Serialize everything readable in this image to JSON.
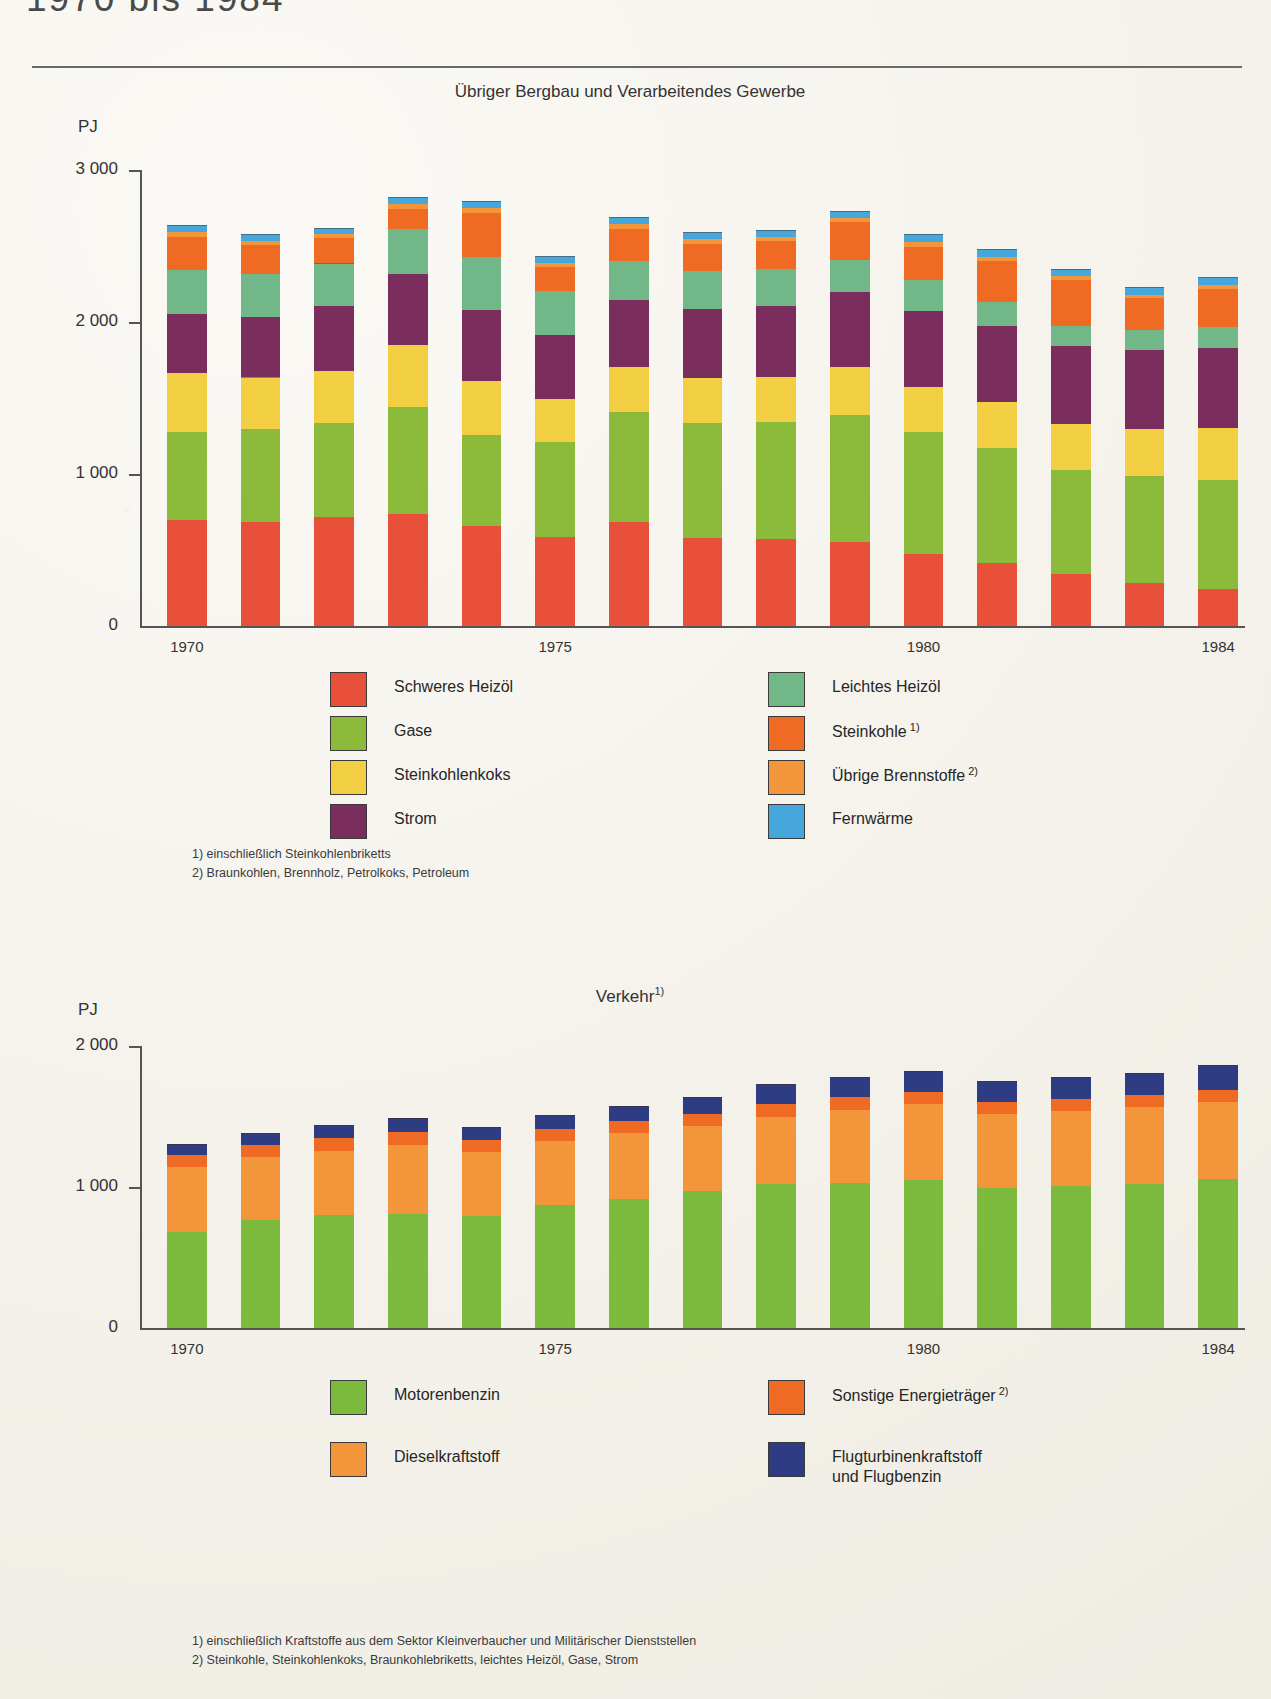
{
  "document": {
    "title": "1970 bis 1984"
  },
  "charts": [
    {
      "id": "bergbau-gewerbe",
      "title": "Übriger Bergbau und Verarbeitendes Gewerbe",
      "title_sup": "",
      "unit": "PJ",
      "y_ticks": [
        "3 000",
        "2 000",
        "1 000",
        "0"
      ],
      "x_ticks": [
        "1970",
        "1975",
        "1980",
        "1984"
      ],
      "footnotes": [
        "1) einschließlich Steinkohlenbriketts",
        "2) Braunkohlen, Brennholz, Petrolkoks, Petroleum"
      ],
      "legend": [
        {
          "label": "Schweres Heizöl",
          "sup": "",
          "color": "#e8503a",
          "col": 0,
          "row": 0
        },
        {
          "label": "Gase",
          "sup": "",
          "color": "#8cbb3c",
          "col": 0,
          "row": 1
        },
        {
          "label": "Steinkohlenkoks",
          "sup": "",
          "color": "#f2ce43",
          "col": 0,
          "row": 2
        },
        {
          "label": "Strom",
          "sup": "",
          "color": "#7b2d5e",
          "col": 0,
          "row": 3
        },
        {
          "label": "Leichtes Heizöl",
          "sup": "",
          "color": "#72b788",
          "col": 1,
          "row": 0
        },
        {
          "label": "Steinkohle",
          "sup": "1)",
          "color": "#ef6a23",
          "col": 1,
          "row": 1
        },
        {
          "label": "Übrige Brennstoffe",
          "sup": "2)",
          "color": "#f2953b",
          "col": 1,
          "row": 2
        },
        {
          "label": "Fernwärme",
          "sup": "",
          "color": "#46a7dd",
          "col": 1,
          "row": 3
        }
      ]
    },
    {
      "id": "verkehr",
      "title": "Verkehr",
      "title_sup": "1)",
      "unit": "PJ",
      "y_ticks": [
        "2 000",
        "1 000",
        "0"
      ],
      "x_ticks": [
        "1970",
        "1975",
        "1980",
        "1984"
      ],
      "footnotes": [
        "1) einschließlich Kraftstoffe aus dem Sektor Kleinverbaucher und Militärischer Dienststellen",
        "2) Steinkohle, Steinkohlenkoks, Braunkohlebriketts, leichtes Heizöl, Gase, Strom"
      ],
      "legend": [
        {
          "label": "Motorenbenzin",
          "sup": "",
          "color": "#7cba3d",
          "col": 0,
          "row": 0,
          "label2": ""
        },
        {
          "label": "Dieselkraftstoff",
          "sup": "",
          "color": "#f2953b",
          "col": 0,
          "row": 1,
          "label2": ""
        },
        {
          "label": "Sonstige Energieträger",
          "sup": "2)",
          "color": "#ef6a23",
          "col": 1,
          "row": 0,
          "label2": ""
        },
        {
          "label": "Flugturbinenkraftstoff",
          "sup": "",
          "color": "#2d3c83",
          "col": 1,
          "row": 1,
          "label2": "und Flugbenzin"
        }
      ]
    }
  ],
  "chart_data": [
    {
      "type": "bar",
      "stacked": true,
      "title": "Übriger Bergbau und Verarbeitendes Gewerbe",
      "xlabel": "",
      "ylabel": "PJ",
      "ylim": [
        0,
        3000
      ],
      "ytick_values": [
        0,
        1000,
        2000,
        3000
      ],
      "grid": false,
      "legend_position": "below",
      "categories": [
        "1970",
        "1971",
        "1972",
        "1973",
        "1974",
        "1975",
        "1976",
        "1977",
        "1978",
        "1979",
        "1980",
        "1981",
        "1982",
        "1983",
        "1984"
      ],
      "series": [
        {
          "name": "Schweres Heizöl",
          "color": "#e8503a",
          "values": [
            695,
            685,
            715,
            735,
            660,
            585,
            685,
            580,
            575,
            550,
            475,
            415,
            340,
            285,
            245
          ]
        },
        {
          "name": "Gase",
          "color": "#8cbb3c",
          "values": [
            580,
            610,
            620,
            705,
            595,
            625,
            720,
            755,
            770,
            840,
            800,
            755,
            685,
            700,
            715
          ]
        },
        {
          "name": "Steinkohlenkoks",
          "color": "#f2ce43",
          "values": [
            390,
            340,
            345,
            410,
            360,
            285,
            300,
            295,
            290,
            315,
            300,
            305,
            305,
            310,
            340
          ]
        },
        {
          "name": "Strom",
          "color": "#7b2d5e",
          "values": [
            390,
            400,
            425,
            465,
            465,
            420,
            440,
            455,
            470,
            490,
            500,
            500,
            510,
            520,
            530
          ]
        },
        {
          "name": "Leichtes Heizöl",
          "color": "#72b788",
          "values": [
            290,
            280,
            280,
            300,
            345,
            290,
            255,
            250,
            245,
            215,
            200,
            155,
            135,
            135,
            140
          ]
        },
        {
          "name": "Steinkohle",
          "color": "#ef6a23",
          "values": [
            215,
            190,
            165,
            130,
            295,
            160,
            215,
            180,
            180,
            250,
            220,
            270,
            300,
            205,
            250
          ]
        },
        {
          "name": "Übrige Brennstoffe",
          "color": "#f2953b",
          "values": [
            35,
            30,
            30,
            30,
            30,
            25,
            30,
            30,
            30,
            25,
            30,
            30,
            25,
            25,
            25
          ]
        },
        {
          "name": "Fernwärme",
          "color": "#46a7dd",
          "values": [
            35,
            35,
            35,
            40,
            40,
            35,
            40,
            40,
            40,
            40,
            45,
            45,
            45,
            45,
            45
          ]
        }
      ],
      "totals": [
        2630,
        2570,
        2615,
        2815,
        2790,
        2425,
        2685,
        2585,
        2600,
        2725,
        2570,
        2475,
        2345,
        2225,
        2290
      ]
    },
    {
      "type": "bar",
      "stacked": true,
      "title": "Verkehr",
      "xlabel": "",
      "ylabel": "PJ",
      "ylim": [
        0,
        2000
      ],
      "ytick_values": [
        0,
        1000,
        2000
      ],
      "grid": false,
      "legend_position": "below",
      "categories": [
        "1970",
        "1971",
        "1972",
        "1973",
        "1974",
        "1975",
        "1976",
        "1977",
        "1978",
        "1979",
        "1980",
        "1981",
        "1982",
        "1983",
        "1984"
      ],
      "series": [
        {
          "name": "Motorenbenzin",
          "color": "#7cba3d",
          "values": [
            680,
            765,
            800,
            810,
            795,
            875,
            915,
            975,
            1020,
            1025,
            1050,
            995,
            1010,
            1020,
            1055
          ]
        },
        {
          "name": "Dieselkraftstoff",
          "color": "#f2953b",
          "values": [
            460,
            450,
            455,
            490,
            450,
            450,
            470,
            460,
            480,
            520,
            540,
            520,
            530,
            545,
            550
          ]
        },
        {
          "name": "Sonstige Energieträger",
          "color": "#ef6a23",
          "values": [
            90,
            85,
            90,
            90,
            85,
            85,
            85,
            85,
            90,
            90,
            85,
            85,
            85,
            85,
            85
          ]
        },
        {
          "name": "Flugturbinenkraftstoff und Flugbenzin",
          "color": "#2d3c83",
          "values": [
            65,
            75,
            90,
            95,
            90,
            95,
            100,
            110,
            135,
            140,
            140,
            145,
            150,
            155,
            165
          ]
        }
      ],
      "totals": [
        1295,
        1375,
        1435,
        1485,
        1420,
        1505,
        1570,
        1630,
        1725,
        1775,
        1815,
        1745,
        1775,
        1805,
        1855
      ]
    }
  ]
}
